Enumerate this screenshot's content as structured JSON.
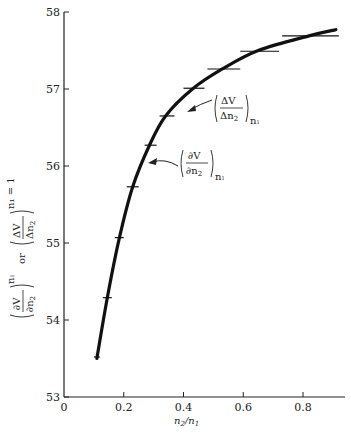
{
  "chart_data": {
    "type": "line",
    "title": "",
    "xlabel": "n2/n1",
    "ylabel": "(∂V/∂n2)n1 or (ΔV/Δn2)n1=1",
    "xlim": [
      0,
      0.94
    ],
    "ylim": [
      53,
      58
    ],
    "grid": false,
    "x_ticks": [
      0,
      0.2,
      0.4,
      0.6,
      0.8
    ],
    "x_tick_labels": [
      "0",
      "0.2",
      "0.4",
      "0.6",
      "0.8"
    ],
    "y_ticks": [
      53,
      54,
      55,
      56,
      57,
      58
    ],
    "y_tick_labels": [
      "53",
      "54",
      "55",
      "56",
      "57",
      "58"
    ],
    "series": [
      {
        "name": "(∂V/∂n2)n1",
        "style": "thick-curve",
        "x": [
          0.11,
          0.145,
          0.185,
          0.23,
          0.285,
          0.34,
          0.43,
          0.53,
          0.65,
          0.82,
          0.91
        ],
        "values": [
          53.5,
          54.29,
          55.06,
          55.73,
          56.26,
          56.65,
          57.0,
          57.26,
          57.5,
          57.69,
          57.77
        ]
      },
      {
        "name": "(ΔV/Δn2)n1",
        "style": "horizontal-bars",
        "x": [
          0.11,
          0.145,
          0.185,
          0.229,
          0.286,
          0.34,
          0.434,
          0.53,
          0.655,
          0.82
        ],
        "x_span": [
          [
            0.1,
            0.12
          ],
          [
            0.13,
            0.16
          ],
          [
            0.17,
            0.2
          ],
          [
            0.21,
            0.25
          ],
          [
            0.27,
            0.31
          ],
          [
            0.32,
            0.37
          ],
          [
            0.4,
            0.47
          ],
          [
            0.48,
            0.59
          ],
          [
            0.59,
            0.72
          ],
          [
            0.73,
            0.92
          ]
        ],
        "values": [
          53.52,
          54.29,
          55.07,
          55.73,
          56.27,
          56.65,
          57.01,
          57.26,
          57.49,
          57.69
        ]
      }
    ],
    "annotations": [
      {
        "text": "(ΔV/Δn2)n1",
        "target_x": 0.42,
        "target_y": 56.84
      },
      {
        "text": "(∂V/∂n2)n1",
        "target_x": 0.285,
        "target_y": 56.05
      }
    ]
  },
  "labels": {
    "x_axis_title_main": "n",
    "x_axis_title_sub1": "2",
    "x_axis_title_slash": "/n",
    "x_axis_title_sub2": "1",
    "y_or": "or",
    "dV": "∂V",
    "dn": "∂n",
    "DV": "ΔV",
    "Dn": "Δn",
    "sub2": "2",
    "sub_n1": "n",
    "sub_1": "1",
    "sub_n1_eq1": "n₁ = 1"
  }
}
